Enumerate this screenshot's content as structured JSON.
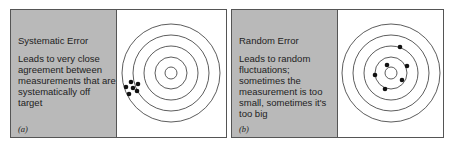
{
  "panels": [
    {
      "title": "Systematic Error",
      "description": "Leads to very close agreement between measurements that are systematically off target",
      "label": "(a)"
    },
    {
      "title": "Random Error",
      "description": "Leads to random fluctuations; sometimes the measurement is too small, sometimes it's too big",
      "label": "(b)"
    }
  ],
  "colors": {
    "sidebar": "#b9b9b9",
    "border": "#555555",
    "ring": "#333333",
    "dot": "#111111"
  }
}
